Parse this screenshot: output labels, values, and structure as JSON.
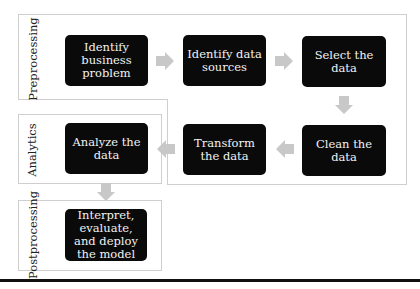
{
  "diagram": {
    "phases": {
      "preprocessing": "Preprocessing",
      "analytics": "Analytics",
      "postprocessing": "Postprocessing"
    },
    "steps": [
      {
        "id": "identify-business-problem",
        "label": "Identify business problem",
        "phase": "preprocessing"
      },
      {
        "id": "identify-data-sources",
        "label": "Identify data sources",
        "phase": "preprocessing"
      },
      {
        "id": "select-the-data",
        "label": "Select the data",
        "phase": "preprocessing"
      },
      {
        "id": "clean-the-data",
        "label": "Clean the data",
        "phase": "preprocessing"
      },
      {
        "id": "transform-the-data",
        "label": "Transform the data",
        "phase": "preprocessing"
      },
      {
        "id": "analyze-the-data",
        "label": "Analyze the data",
        "phase": "analytics"
      },
      {
        "id": "interpret-evaluate-deploy",
        "label": "Interpret, evaluate, and deploy the model",
        "phase": "postprocessing"
      }
    ],
    "flow": [
      [
        "identify-business-problem",
        "identify-data-sources"
      ],
      [
        "identify-data-sources",
        "select-the-data"
      ],
      [
        "select-the-data",
        "clean-the-data"
      ],
      [
        "clean-the-data",
        "transform-the-data"
      ],
      [
        "transform-the-data",
        "analyze-the-data"
      ],
      [
        "analyze-the-data",
        "interpret-evaluate-deploy"
      ]
    ],
    "colors": {
      "box_fill": "#0a0a0a",
      "box_text": "#f2f2f2",
      "arrow": "#c8c8c8",
      "panel_border": "#cfcfcf"
    }
  }
}
